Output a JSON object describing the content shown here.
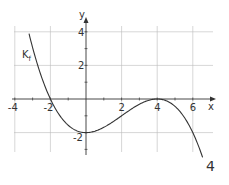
{
  "chart_data": {
    "type": "line",
    "title": "",
    "xlabel": "x",
    "ylabel": "y",
    "xlim": [
      -4.1,
      7.2
    ],
    "ylim": [
      -3.4,
      4.8
    ],
    "grid": true,
    "x_ticks": [
      "-4",
      "-2",
      "2",
      "4",
      "6"
    ],
    "y_ticks": [
      "4",
      "2",
      "-2"
    ],
    "series": [
      {
        "name": "K_f",
        "formula": "f(x) = -1/16 (x+2)(x-4)^2",
        "x": [
          -3.2,
          -3,
          -2,
          -1,
          0,
          1,
          2,
          3,
          4,
          5,
          6,
          6.5
        ],
        "values": [
          4.9,
          3.06,
          0,
          -1.56,
          -2,
          -1.69,
          -1,
          -0.31,
          0,
          -0.44,
          -2,
          -3.3
        ]
      }
    ],
    "annotations": [
      "K_f"
    ]
  },
  "labels": {
    "curve_label": "K",
    "curve_label_sub": "f",
    "x_axis": "x",
    "y_axis": "y",
    "page_number": "4"
  },
  "colors": {
    "grid": "#bbbbbb",
    "axis": "#333333",
    "curve": "#333333"
  }
}
